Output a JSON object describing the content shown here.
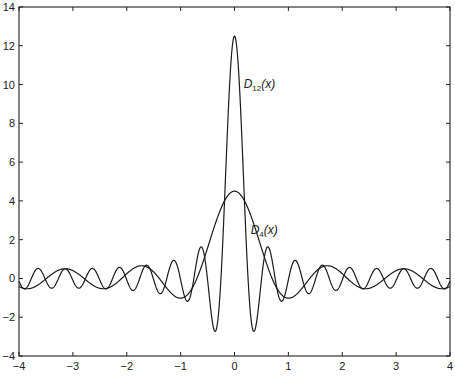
{
  "chart_data": {
    "type": "line",
    "title": "",
    "xlabel": "",
    "ylabel": "",
    "xlim": [
      -4,
      4
    ],
    "ylim": [
      -4,
      14
    ],
    "grid": false,
    "legend": "none",
    "x_ticks": [
      -4,
      -3,
      -2,
      -1,
      0,
      1,
      2,
      3,
      4
    ],
    "y_ticks": [
      -4,
      -2,
      0,
      2,
      4,
      6,
      8,
      10,
      12,
      14
    ],
    "series": [
      {
        "name": "D_12(x)",
        "formula": "sin((n+1/2)x) / (2 sin(x/2)), n = 12",
        "n": 12,
        "peak_value_at_0": 12.5,
        "label": {
          "main": "D",
          "sub": "12",
          "tail": "(x)",
          "x": 0.17,
          "y": 9.8
        },
        "sample_points": {
          "x": [
            -4,
            -3,
            -1,
            -0.36,
            0,
            0.36,
            1,
            3,
            4
          ],
          "y": [
            -0.37,
            0.48,
            -0.88,
            -2.7,
            12.5,
            -2.7,
            -0.88,
            0.48,
            -0.37
          ]
        }
      },
      {
        "name": "D_4(x)",
        "formula": "sin((n+1/2)x) / (2 sin(x/2)), n = 4",
        "n": 4,
        "peak_value_at_0": 4.5,
        "label": {
          "main": "D",
          "sub": "4",
          "tail": "(x)",
          "x": 0.3,
          "y": 2.3
        },
        "sample_points": {
          "x": [
            -4,
            -3.14,
            -1,
            0,
            1,
            3.14,
            4
          ],
          "y": [
            -0.4,
            0.5,
            -1.0,
            4.5,
            -1.0,
            0.5,
            -0.4
          ]
        }
      }
    ]
  }
}
